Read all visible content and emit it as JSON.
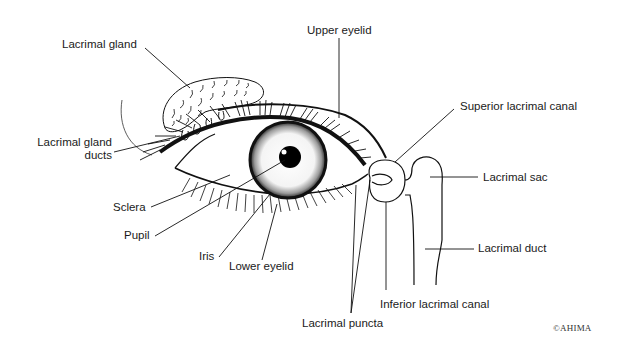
{
  "diagram": {
    "line_color": "#111111",
    "background": "#ffffff",
    "labels": {
      "lacrimal_gland": "Lacrimal gland",
      "upper_eyelid": "Upper eyelid",
      "superior_lacrimal_canal": "Superior lacrimal canal",
      "lacrimal_gland_ducts_line1": "Lacrimal gland",
      "lacrimal_gland_ducts_line2": "ducts",
      "lacrimal_sac": "Lacrimal sac",
      "sclera": "Sclera",
      "pupil": "Pupil",
      "iris": "Iris",
      "lower_eyelid": "Lower eyelid",
      "lacrimal_duct": "Lacrimal duct",
      "inferior_lacrimal_canal": "Inferior lacrimal canal",
      "lacrimal_puncta": "Lacrimal puncta"
    },
    "copyright": "©AHIMA"
  }
}
